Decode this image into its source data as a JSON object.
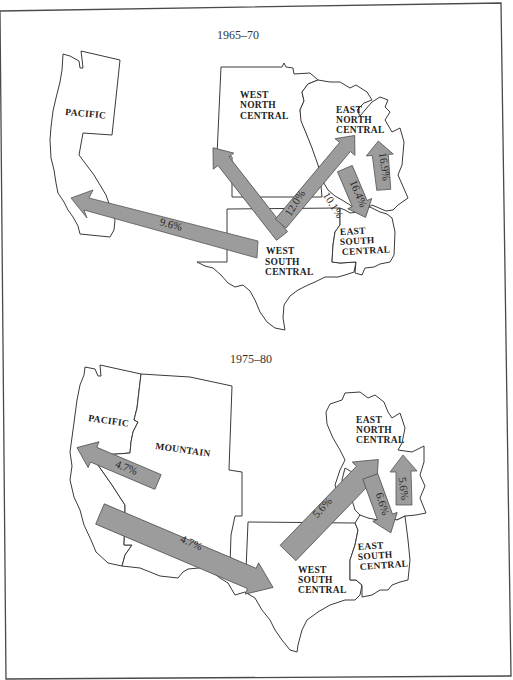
{
  "figure": {
    "type": "migration-flow-map",
    "colors": {
      "arrow_fill": "#9c9c9c",
      "arrow_stroke": "#555555",
      "outline": "#3a3a3a",
      "background": "#ffffff"
    }
  },
  "panels": [
    {
      "title": "1965–70",
      "regions": {
        "pacific": "PACIFIC",
        "wnc": [
          "WEST",
          "NORTH",
          "CENTRAL"
        ],
        "enc": [
          "EAST",
          "NORTH",
          "CENTRAL"
        ],
        "wsc": [
          "WEST",
          "SOUTH",
          "CENTRAL"
        ],
        "esc": [
          "EAST",
          "SOUTH",
          "CENTRAL"
        ]
      },
      "flows": [
        {
          "from": "WEST SOUTH CENTRAL",
          "to": "PACIFIC",
          "label": "9.6%"
        },
        {
          "from": "WEST SOUTH CENTRAL",
          "to": "WEST NORTH CENTRAL",
          "label": "12.0%"
        },
        {
          "from": "EAST NORTH CENTRAL",
          "to": "WEST SOUTH CENTRAL",
          "label": "10.1%"
        },
        {
          "from": "EAST NORTH CENTRAL",
          "to": "EAST SOUTH CENTRAL",
          "label": "16.4%"
        },
        {
          "from": "EAST SOUTH CENTRAL",
          "to": "EAST NORTH CENTRAL",
          "label": "16.9%"
        }
      ]
    },
    {
      "title": "1975–80",
      "regions": {
        "pacific": "PACIFIC",
        "mountain": "MOUNTAIN",
        "enc": [
          "EAST",
          "NORTH",
          "CENTRAL"
        ],
        "wsc": [
          "WEST",
          "SOUTH",
          "CENTRAL"
        ],
        "esc": [
          "EAST",
          "SOUTH",
          "CENTRAL"
        ]
      },
      "flows": [
        {
          "from": "MOUNTAIN",
          "to": "PACIFIC",
          "label": "4.7%"
        },
        {
          "from": "PACIFIC",
          "to": "WEST SOUTH CENTRAL",
          "label": "4.7%"
        },
        {
          "from": "WEST SOUTH CENTRAL",
          "to": "EAST NORTH CENTRAL",
          "label": "5.6%"
        },
        {
          "from": "EAST NORTH CENTRAL",
          "to": "EAST SOUTH CENTRAL",
          "label": "6.6%"
        },
        {
          "from": "EAST SOUTH CENTRAL",
          "to": "EAST NORTH CENTRAL",
          "label": "5.6%"
        }
      ]
    }
  ]
}
